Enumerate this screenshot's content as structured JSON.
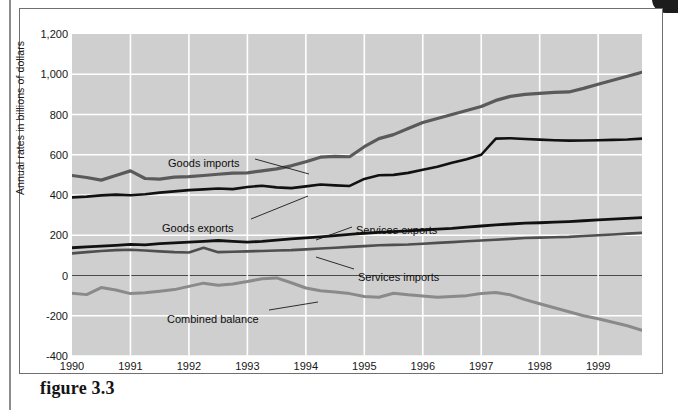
{
  "figure": {
    "caption": "figure 3.3"
  },
  "colors": {
    "plot_background": "#cfcfcf",
    "grid": "#ffffff",
    "axis": "#4a4a4a",
    "goods_imports": "#5a5a5a",
    "goods_exports": "#111111",
    "services_exports": "#111111",
    "services_imports": "#4f4f4f",
    "combined_balance": "#8a8a8a",
    "text": "#141414",
    "page_rule": "#8d8d8d"
  },
  "chart_data": {
    "type": "line",
    "title": "",
    "xlabel": "",
    "ylabel": "Annual rates in billions of dollars",
    "ylim": [
      -400,
      1200
    ],
    "yticks": [
      1200,
      1000,
      800,
      600,
      400,
      200,
      0,
      -200,
      -400
    ],
    "ytick_labels": [
      "1,200",
      "1,000",
      "800",
      "600",
      "400",
      "200",
      "0",
      "-200",
      "-400"
    ],
    "xlim": [
      1990,
      1999.75
    ],
    "xticks": [
      1990,
      1991,
      1992,
      1993,
      1994,
      1995,
      1996,
      1997,
      1998,
      1999
    ],
    "xtick_labels": [
      "1990",
      "1991",
      "1992",
      "1993",
      "1994",
      "1995",
      "1996",
      "1997",
      "1998",
      "1999"
    ],
    "grid": true,
    "legend_position": "inline-annotations",
    "x": [
      1990,
      1990.25,
      1990.5,
      1990.75,
      1991,
      1991.25,
      1991.5,
      1991.75,
      1992,
      1992.25,
      1992.5,
      1992.75,
      1993,
      1993.25,
      1993.5,
      1993.75,
      1994,
      1994.25,
      1994.5,
      1994.75,
      1995,
      1995.25,
      1995.5,
      1995.75,
      1996,
      1996.25,
      1996.5,
      1996.75,
      1997,
      1997.25,
      1997.5,
      1997.75,
      1998,
      1998.25,
      1998.5,
      1998.75,
      1999,
      1999.25,
      1999.5,
      1999.75
    ],
    "series": [
      {
        "name": "Goods imports",
        "color": "#5a5a5a",
        "width": 3.2,
        "values": [
          497,
          487,
          474,
          497,
          520,
          482,
          479,
          489,
          491,
          497,
          503,
          509,
          510,
          520,
          530,
          545,
          565,
          588,
          592,
          590,
          640,
          680,
          700,
          730,
          760,
          780,
          800,
          820,
          840,
          870,
          890,
          900,
          905,
          910,
          912,
          930,
          950,
          970,
          990,
          1010
        ]
      },
      {
        "name": "Goods exports",
        "color": "#111111",
        "width": 2.6,
        "values": [
          388,
          392,
          398,
          402,
          399,
          404,
          412,
          418,
          424,
          428,
          432,
          429,
          440,
          446,
          438,
          434,
          443,
          452,
          448,
          445,
          480,
          498,
          500,
          510,
          525,
          540,
          560,
          578,
          600,
          680,
          682,
          678,
          675,
          672,
          670,
          671,
          672,
          674,
          676,
          680
        ]
      },
      {
        "name": "Services exports",
        "color": "#111111",
        "width": 2.8,
        "values": [
          138,
          142,
          146,
          150,
          155,
          152,
          158,
          162,
          166,
          170,
          174,
          170,
          166,
          170,
          176,
          182,
          187,
          192,
          198,
          204,
          210,
          214,
          218,
          222,
          226,
          230,
          234,
          240,
          246,
          252,
          256,
          260,
          262,
          265,
          268,
          272,
          276,
          280,
          284,
          288
        ]
      },
      {
        "name": "Services imports",
        "color": "#4f4f4f",
        "width": 2.6,
        "values": [
          110,
          116,
          122,
          126,
          128,
          124,
          120,
          116,
          114,
          138,
          116,
          118,
          120,
          122,
          124,
          126,
          130,
          134,
          138,
          142,
          146,
          150,
          152,
          154,
          158,
          162,
          166,
          170,
          174,
          178,
          182,
          186,
          188,
          190,
          192,
          196,
          200,
          204,
          208,
          212
        ]
      },
      {
        "name": "Combined balance",
        "color": "#8a8a8a",
        "width": 3.0,
        "values": [
          -88,
          -95,
          -60,
          -72,
          -90,
          -86,
          -78,
          -70,
          -54,
          -38,
          -48,
          -42,
          -30,
          -16,
          -12,
          -36,
          -62,
          -76,
          -82,
          -90,
          -104,
          -108,
          -88,
          -96,
          -102,
          -108,
          -104,
          -100,
          -90,
          -84,
          -96,
          -120,
          -140,
          -160,
          -180,
          -200,
          -215,
          -232,
          -250,
          -272
        ]
      }
    ],
    "annotations": [
      {
        "label": "Goods imports",
        "label_x": 148,
        "label_y": 148,
        "leader": [
          [
            235,
            150
          ],
          [
            289,
            165
          ]
        ]
      },
      {
        "label": "Goods exports",
        "label_x": 142,
        "label_y": 213,
        "leader": [
          [
            231,
            210
          ],
          [
            288,
            187
          ]
        ]
      },
      {
        "label": "Services exports",
        "label_x": 336,
        "label_y": 215,
        "leader": [
          [
            332,
            218
          ],
          [
            296,
            231
          ]
        ]
      },
      {
        "label": "Services imports",
        "label_x": 338,
        "label_y": 262,
        "leader": [
          [
            334,
            260
          ],
          [
            296,
            248
          ]
        ]
      },
      {
        "label": "Combined balance",
        "label_x": 147,
        "label_y": 304,
        "leader": [
          [
            249,
            301
          ],
          [
            298,
            293
          ]
        ]
      }
    ]
  }
}
